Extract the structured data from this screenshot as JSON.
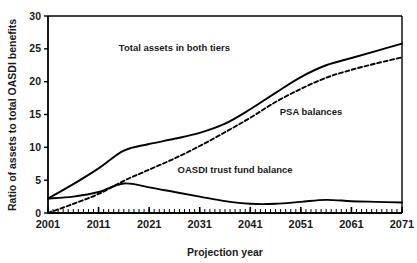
{
  "chart_data": {
    "type": "line",
    "title": "",
    "xlabel": "Projection year",
    "ylabel": "Ratio of assets to total OASDI benefits",
    "xlim": [
      2001,
      2071
    ],
    "ylim": [
      0,
      30
    ],
    "xticks": [
      "2001",
      "2011",
      "2021",
      "2031",
      "2041",
      "2051",
      "2061",
      "2071"
    ],
    "xtick_values": [
      2001,
      2011,
      2021,
      2031,
      2041,
      2051,
      2061,
      2071
    ],
    "yticks": [
      "0",
      "5",
      "10",
      "15",
      "20",
      "25",
      "30"
    ],
    "ytick_values": [
      0,
      5,
      10,
      15,
      20,
      25,
      30
    ],
    "minor_xtick_step": 1,
    "grid": false,
    "legend_position": "inline-annotations",
    "series": [
      {
        "name": "Total assets in both tiers",
        "style": "solid",
        "color": "#000000",
        "annotation": "Total assets in both tiers",
        "annotation_x": 2026,
        "annotation_y": 24.6,
        "x": [
          2001,
          2006,
          2011,
          2016,
          2021,
          2026,
          2031,
          2036,
          2041,
          2046,
          2051,
          2056,
          2061,
          2066,
          2071
        ],
        "values": [
          2.2,
          4.4,
          6.8,
          9.5,
          10.5,
          11.3,
          12.2,
          13.6,
          15.8,
          18.3,
          20.7,
          22.5,
          23.6,
          24.7,
          25.8
        ]
      },
      {
        "name": "PSA balances",
        "style": "dashed",
        "color": "#000000",
        "annotation": "PSA balances",
        "annotation_x": 2053,
        "annotation_y": 15.0,
        "x": [
          2001,
          2006,
          2011,
          2016,
          2021,
          2026,
          2031,
          2036,
          2041,
          2046,
          2051,
          2056,
          2061,
          2066,
          2071
        ],
        "values": [
          0.0,
          1.4,
          2.9,
          4.9,
          6.6,
          8.3,
          10.2,
          12.3,
          14.5,
          16.9,
          18.9,
          20.6,
          21.8,
          22.8,
          23.7
        ]
      },
      {
        "name": "OASDI trust fund balance",
        "style": "solid",
        "color": "#000000",
        "annotation": "OASDI trust fund balance",
        "annotation_x": 2038,
        "annotation_y": 6.1,
        "x": [
          2001,
          2006,
          2011,
          2016,
          2021,
          2026,
          2031,
          2036,
          2041,
          2046,
          2051,
          2056,
          2061,
          2066,
          2071
        ],
        "values": [
          2.2,
          2.5,
          3.2,
          4.5,
          3.9,
          3.2,
          2.5,
          1.8,
          1.4,
          1.4,
          1.7,
          2.0,
          1.8,
          1.7,
          1.6
        ]
      }
    ]
  }
}
